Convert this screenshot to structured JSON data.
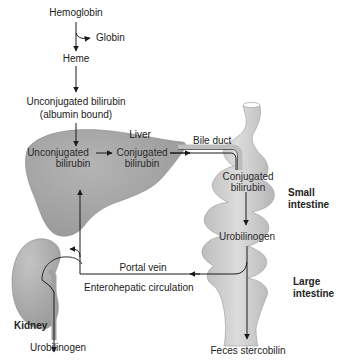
{
  "diagram": {
    "labels": {
      "hemoglobin": "Hemoglobin",
      "globin": "Globin",
      "heme": "Heme",
      "unconjugated_top_1": "Unconjugated bilirubin",
      "unconjugated_top_2": "(albumin bound)",
      "liver": "Liver",
      "liver_unconj_1": "Unconjugated",
      "liver_unconj_2": "bilirubin",
      "liver_conj_1": "Conjugated",
      "liver_conj_2": "bilirubin",
      "bile_duct": "Bile duct",
      "intestine_conj_1": "Conjugated",
      "intestine_conj_2": "bilirubin",
      "small_intestine_1": "Small",
      "small_intestine_2": "intestine",
      "urobilinogen_intestine": "Urobilinogen",
      "portal_vein": "Portal vein",
      "enterohepatic": "Enterohepatic circulation",
      "large_intestine_1": "Large",
      "large_intestine_2": "intestine",
      "kidney": "Kidney",
      "urobilinogen_kidney": "Urobilinogen",
      "feces": "Feces stercobilin"
    },
    "colors": {
      "organ_fill": "#a8a8a8",
      "intestine_fill": "#c9c9c9",
      "line": "#1a1a1a"
    }
  }
}
